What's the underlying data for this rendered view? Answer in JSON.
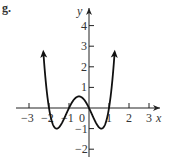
{
  "figure": {
    "label": "g."
  },
  "chart_data": {
    "type": "line",
    "title": "",
    "xlabel": "x",
    "ylabel": "y",
    "x_ticks": [
      -3,
      -2,
      -1,
      0,
      1,
      2,
      3
    ],
    "y_ticks": [
      -2,
      -1,
      1,
      2,
      3,
      4
    ],
    "x_tick_labels": [
      "−3",
      "−2",
      "−1",
      "0",
      "1",
      "2",
      "3"
    ],
    "y_tick_labels": [
      "−2",
      "−1",
      "1",
      "2",
      "3",
      "4"
    ],
    "xlim": [
      -3.5,
      3.5
    ],
    "ylim": [
      -2.3,
      4.8
    ],
    "grid": false,
    "legend": null,
    "series": [
      {
        "name": "f(x)",
        "description": "Quartic polynomial with zeros at x = -2, -1, 0, 1; local minima near (-1.6, -1) and (0.6, -1); local maximum near (-0.5, 0.56); arrows at both ends pointing upward",
        "x": [
          -2.3,
          -2.2,
          -2.1,
          -2.0,
          -1.9,
          -1.8,
          -1.7,
          -1.618,
          -1.5,
          -1.4,
          -1.3,
          -1.2,
          -1.1,
          -1.0,
          -0.9,
          -0.8,
          -0.7,
          -0.6,
          -0.5,
          -0.4,
          -0.3,
          -0.2,
          -0.1,
          0.0,
          0.1,
          0.2,
          0.3,
          0.4,
          0.5,
          0.618,
          0.7,
          0.8,
          0.9,
          1.0,
          1.1,
          1.2,
          1.3
        ],
        "y": [
          4.68,
          2.82,
          1.41,
          0.0,
          -0.6,
          -0.94,
          -0.98,
          -1.0,
          -0.94,
          -0.67,
          -0.41,
          -0.18,
          0.02,
          0.0,
          0.17,
          0.34,
          0.46,
          0.53,
          0.56,
          0.53,
          0.46,
          0.34,
          0.17,
          0.0,
          -0.21,
          -0.42,
          -0.63,
          -0.85,
          -0.94,
          -1.0,
          -0.91,
          -0.73,
          -0.34,
          0.0,
          0.63,
          1.61,
          3.06
        ],
        "arrows": "both-ends-up"
      }
    ],
    "extrema": {
      "local_min": [
        [
          -1.618,
          -1
        ],
        [
          0.618,
          -1
        ]
      ],
      "local_max": [
        [
          -0.5,
          0.5625
        ]
      ]
    },
    "zeros": [
      -2,
      -1,
      0,
      1
    ]
  }
}
